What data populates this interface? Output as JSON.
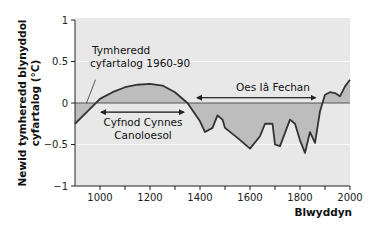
{
  "chart_data": {
    "type": "area",
    "title": "",
    "xlabel": "Blwyddyn",
    "ylabel_lines": [
      "Newid tymheredd blynyddol",
      "cyfartalog (°C)"
    ],
    "xlim": [
      900,
      2000
    ],
    "ylim": [
      -1,
      1
    ],
    "x_ticks": [
      1000,
      1200,
      1400,
      1600,
      1800,
      2000
    ],
    "x_minor_ticks": [
      1100,
      1300,
      1500,
      1700,
      1900
    ],
    "y_ticks": [
      1,
      0.5,
      0,
      -0.5,
      -1
    ],
    "y_tick_labels": [
      "1",
      "0.5",
      "0",
      "−0.5",
      "−1"
    ],
    "grid": "horizontal white lines at ±0.5",
    "baseline": 0,
    "series": [
      {
        "name": "Newid tymheredd",
        "x": [
          900,
          950,
          1000,
          1050,
          1100,
          1150,
          1200,
          1250,
          1300,
          1350,
          1400,
          1420,
          1450,
          1470,
          1490,
          1500,
          1550,
          1600,
          1640,
          1660,
          1690,
          1700,
          1720,
          1760,
          1780,
          1800,
          1820,
          1840,
          1860,
          1880,
          1900,
          1920,
          1940,
          1960,
          1980,
          2000
        ],
        "values": [
          -0.25,
          -0.1,
          0.05,
          0.13,
          0.19,
          0.22,
          0.23,
          0.21,
          0.13,
          0.0,
          -0.22,
          -0.35,
          -0.3,
          -0.15,
          -0.2,
          -0.3,
          -0.42,
          -0.55,
          -0.4,
          -0.25,
          -0.25,
          -0.5,
          -0.52,
          -0.2,
          -0.25,
          -0.45,
          -0.6,
          -0.35,
          -0.48,
          -0.1,
          0.1,
          0.13,
          0.12,
          0.08,
          0.2,
          0.28
        ]
      }
    ],
    "annotations": [
      {
        "text_lines": [
          "Tymheredd",
          "cyfartalog 1960-90"
        ],
        "target": "baseline",
        "leader_to_year": 950
      },
      {
        "text_lines": [
          "Cyfnod Cynnes",
          "Canoloesol"
        ],
        "arrow_from_year": 980,
        "arrow_to_year": 1360,
        "arrow_value": -0.11
      },
      {
        "text_lines": [
          "Oes Iâ Fechan"
        ],
        "arrow_from_year": 1380,
        "arrow_to_year": 1870,
        "arrow_value": 0.1
      }
    ],
    "colors": {
      "plot_background": "#e8e8e8",
      "fill": "#bdbdbd",
      "line": "#333333",
      "baseline": "#555555",
      "grid": "#fafafa",
      "axis": "#222222"
    }
  }
}
